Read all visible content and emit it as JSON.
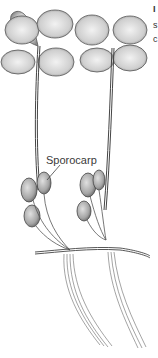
{
  "figure": {
    "callout_label": "Sporocarp",
    "cut_text": [
      "I",
      "s",
      "c"
    ]
  },
  "colors": {
    "background": "#ffffff",
    "ink": "#3a3a3a",
    "leaf_fill": "#d9d9d9",
    "sporocarp_fill": "#bdbdbd"
  }
}
